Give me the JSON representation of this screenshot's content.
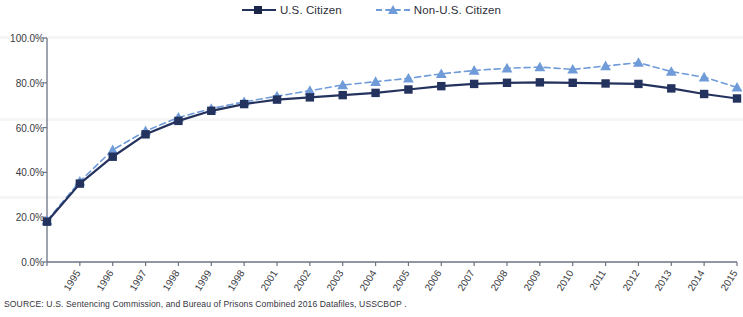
{
  "chart_data": {
    "type": "line",
    "title": "",
    "subtitle": "",
    "xlabel": "",
    "ylabel": "",
    "ylim": [
      0,
      100
    ],
    "y_tick_labels": [
      "0.0%",
      "20.0%",
      "40.0%",
      "60.0%",
      "80.0%",
      "100.0%"
    ],
    "y_tick_values": [
      0,
      20,
      40,
      60,
      80,
      100
    ],
    "grid": false,
    "legend_position": "top-center",
    "categories": [
      "1995",
      "1996",
      "1997",
      "1998",
      "1999",
      "2000",
      "2001",
      "2002",
      "2003",
      "2004",
      "2005",
      "2006",
      "2007",
      "2008",
      "2009",
      "2010",
      "2011",
      "2012",
      "2013",
      "2014",
      "2015",
      "2016"
    ],
    "x_tick_labels": [
      "1995",
      "1996",
      "1997",
      "1998",
      "1999",
      "1998",
      "2001",
      "2002",
      "2003",
      "2004",
      "2005",
      "2006",
      "2007",
      "2008",
      "2009",
      "2010",
      "2011",
      "2012",
      "2013",
      "2014",
      "2015",
      "201"
    ],
    "series": [
      {
        "name": "U.S. Citizen",
        "color": "#24325e",
        "marker": "square",
        "line_style": "solid",
        "values": [
          18.0,
          35.0,
          47.0,
          57.0,
          63.0,
          67.5,
          70.5,
          72.5,
          73.5,
          74.5,
          75.5,
          77.0,
          78.5,
          79.5,
          80.0,
          80.2,
          80.0,
          79.7,
          79.5,
          77.5,
          75.0,
          73.0
        ]
      },
      {
        "name": "Non-U.S. Citizen",
        "color": "#6f9bd8",
        "marker": "triangle",
        "line_style": "dashed",
        "values": [
          18.5,
          36.0,
          50.0,
          58.5,
          64.5,
          68.5,
          71.5,
          74.0,
          76.5,
          79.0,
          80.5,
          82.0,
          84.0,
          85.5,
          86.5,
          87.0,
          86.0,
          87.5,
          89.0,
          85.0,
          82.5,
          78.0
        ]
      }
    ]
  },
  "legend": {
    "entries": [
      {
        "label": "U.S. Citizen"
      },
      {
        "label": "Non-U.S. Citizen"
      }
    ]
  },
  "footer": {
    "source": "SOURCE:  U.S. Sentencing  Commission, and Bureau of Prisons Combined 2016 Datafiles, USSCBOP ."
  }
}
